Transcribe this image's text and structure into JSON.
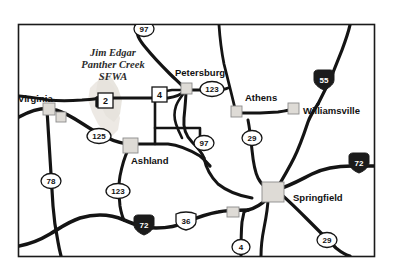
{
  "map": {
    "title": "Illinois regional road map — Springfield area",
    "frame": {
      "border_color": "#1a1a1a",
      "background": "#ffffff"
    },
    "park": {
      "name_line1": "Jim Edgar",
      "name_line2": "Panther Creek",
      "name_line3": "SFWA",
      "fill_color": "#e8e4df"
    },
    "cities": [
      {
        "name": "Virginia",
        "label_x": 18,
        "label_y": 102,
        "marker_x": 48,
        "marker_y": 108,
        "anchor": "start"
      },
      {
        "name": "Petersburg",
        "label_x": 175,
        "label_y": 76,
        "marker_x": 186,
        "marker_y": 88,
        "anchor": "start"
      },
      {
        "name": "Athens",
        "label_x": 242,
        "label_y": 100,
        "marker_x": 236,
        "marker_y": 110,
        "anchor": "start"
      },
      {
        "name": "Williamsville",
        "label_x": 307,
        "label_y": 114,
        "marker_x": 291,
        "marker_y": 108,
        "anchor": "start"
      },
      {
        "name": "Ashland",
        "label_x": 131,
        "label_y": 163,
        "marker_x": 128,
        "marker_y": 145,
        "anchor": "start"
      },
      {
        "name": "Springfield",
        "label_x": 297,
        "label_y": 201,
        "marker_x": 268,
        "marker_y": 190,
        "anchor": "start"
      }
    ],
    "routes": [
      {
        "id": "97-north",
        "number": "97",
        "type": "state-oval",
        "x": 144,
        "y": 29
      },
      {
        "id": "2",
        "number": "2",
        "type": "state-square",
        "x": 105,
        "y": 101
      },
      {
        "id": "4-north",
        "number": "4",
        "type": "state-square",
        "x": 159,
        "y": 95
      },
      {
        "id": "123-north",
        "number": "123",
        "type": "state-oval",
        "x": 212,
        "y": 89
      },
      {
        "id": "55",
        "number": "55",
        "type": "interstate",
        "x": 324,
        "y": 81
      },
      {
        "id": "125",
        "number": "125",
        "type": "state-oval",
        "x": 99,
        "y": 136
      },
      {
        "id": "97-mid",
        "number": "97",
        "type": "state-oval",
        "x": 204,
        "y": 143
      },
      {
        "id": "29-north",
        "number": "29",
        "type": "state-oval",
        "x": 252,
        "y": 138
      },
      {
        "id": "72-east",
        "number": "72",
        "type": "interstate",
        "x": 359,
        "y": 164
      },
      {
        "id": "78",
        "number": "78",
        "type": "state-oval",
        "x": 51,
        "y": 181
      },
      {
        "id": "123-south",
        "number": "123",
        "type": "state-oval",
        "x": 118,
        "y": 191
      },
      {
        "id": "72-west",
        "number": "72",
        "type": "interstate",
        "x": 144,
        "y": 226
      },
      {
        "id": "36",
        "number": "36",
        "type": "us-shield",
        "x": 186,
        "y": 221
      },
      {
        "id": "4-south",
        "number": "4",
        "type": "state-oval",
        "x": 241,
        "y": 247
      },
      {
        "id": "29-south",
        "number": "29",
        "type": "state-oval",
        "x": 327,
        "y": 240
      }
    ],
    "colors": {
      "road": "#141414",
      "border": "#1a1a1a",
      "interstate_fill": "#1b1b1b",
      "marker_fill": "#dedbd6",
      "marker_stroke": "#8c8c8c",
      "text": "#111111"
    }
  }
}
